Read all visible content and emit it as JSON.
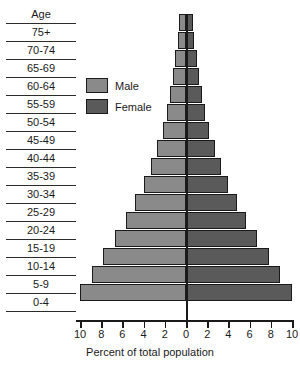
{
  "age_column": {
    "header": "Age",
    "labels": [
      "75+",
      "70-74",
      "65-69",
      "60-64",
      "55-59",
      "50-54",
      "45-49",
      "40-44",
      "35-39",
      "30-34",
      "25-29",
      "20-24",
      "15-19",
      "10-14",
      "5-9",
      "0-4"
    ]
  },
  "legend": {
    "items": [
      {
        "label": "Male",
        "color": "#8a8a8a"
      },
      {
        "label": "Female",
        "color": "#5a5a5a"
      }
    ]
  },
  "axis": {
    "label": "Percent of total population",
    "tick_labels": [
      "10",
      "8",
      "6",
      "4",
      "2",
      "0",
      "2",
      "4",
      "6",
      "8",
      "10"
    ]
  },
  "chart_data": {
    "type": "bar",
    "title": "",
    "subtitle": "",
    "orientation": "horizontal",
    "style": "population-pyramid",
    "xlabel": "Percent of total population",
    "ylabel": "Age",
    "xlim": [
      -10,
      10
    ],
    "xticks": [
      -10,
      -8,
      -6,
      -4,
      -2,
      0,
      2,
      4,
      6,
      8,
      10
    ],
    "xtick_labels": [
      "10",
      "8",
      "6",
      "4",
      "2",
      "0",
      "2",
      "4",
      "6",
      "8",
      "10"
    ],
    "grid": false,
    "legend_position": "upper-left",
    "categories": [
      "75+",
      "70-74",
      "65-69",
      "60-64",
      "55-59",
      "50-54",
      "45-49",
      "40-44",
      "35-39",
      "30-34",
      "25-29",
      "20-24",
      "15-19",
      "10-14",
      "5-9",
      "0-4"
    ],
    "series": [
      {
        "name": "Male",
        "color": "#8a8a8a",
        "side": "left",
        "values": [
          0.7,
          0.8,
          1.0,
          1.2,
          1.5,
          1.8,
          2.2,
          2.7,
          3.3,
          4.0,
          4.8,
          5.7,
          6.7,
          7.8,
          8.9,
          10.0
        ]
      },
      {
        "name": "Female",
        "color": "#5a5a5a",
        "side": "right",
        "values": [
          0.7,
          0.8,
          1.0,
          1.2,
          1.5,
          1.8,
          2.2,
          2.7,
          3.3,
          4.0,
          4.8,
          5.7,
          6.7,
          7.8,
          8.9,
          10.0
        ]
      }
    ]
  }
}
